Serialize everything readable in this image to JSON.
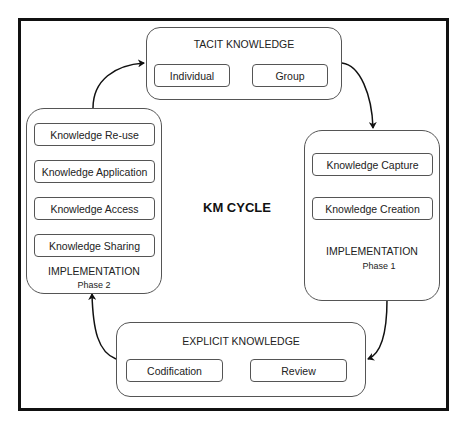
{
  "diagram": {
    "center_label": "KM CYCLE",
    "tacit": {
      "title": "TACIT KNOWLEDGE",
      "items": [
        "Individual",
        "Group"
      ]
    },
    "implementation_phase1": {
      "items": [
        "Knowledge Capture",
        "Knowledge Creation"
      ],
      "title": "IMPLEMENTATION",
      "phase": "Phase 1"
    },
    "explicit": {
      "title": "EXPLICIT KNOWLEDGE",
      "items": [
        "Codification",
        "Review"
      ]
    },
    "implementation_phase2": {
      "items": [
        "Knowledge Re-use",
        "Knowledge Application",
        "Knowledge Access",
        "Knowledge Sharing"
      ],
      "title": "IMPLEMENTATION",
      "phase": "Phase 2"
    },
    "flow": [
      {
        "from": "tacit",
        "to": "implementation_phase1"
      },
      {
        "from": "implementation_phase1",
        "to": "explicit"
      },
      {
        "from": "explicit",
        "to": "implementation_phase2"
      },
      {
        "from": "implementation_phase2",
        "to": "tacit"
      }
    ]
  }
}
